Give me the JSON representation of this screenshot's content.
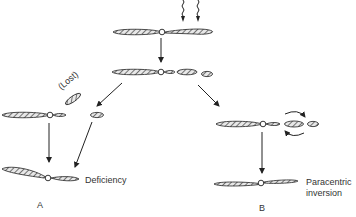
{
  "diagram": {
    "type": "chromosome-breakage-rearrangement",
    "labels": {
      "lost": "(Lost)",
      "deficiency": "Deficiency",
      "paracentric_line1": "Paracentric",
      "paracentric_line2": "inversion",
      "panel_a": "A",
      "panel_b": "B"
    },
    "colors": {
      "ink": "#333333",
      "hatch": "#777777",
      "background": "#ffffff"
    }
  }
}
